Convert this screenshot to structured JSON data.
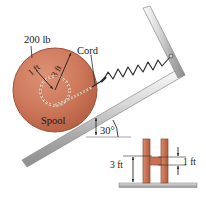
{
  "figure": {
    "type": "engineering-mechanics-diagram",
    "labels": {
      "weight": "200 lb",
      "cord": "Cord",
      "spool": "Spool",
      "inner_radius": "1 ft",
      "outer_radius": "3 ft",
      "incline_angle": "30°",
      "detail_height": "3 ft",
      "detail_hub_width": "1 ft"
    },
    "colors": {
      "spool_fill": "#cd7a5e",
      "spool_edge": "#9e4f38",
      "surface_gray": "#b8b8b8",
      "surface_edge": "#8a8a8a",
      "line_dark": "#2b2b2b",
      "hub_fill": "#c06a4e",
      "background": "#ffffff"
    },
    "geometry": {
      "incline_angle_deg": 30,
      "spool_outer_radius_ft": 3,
      "spool_inner_radius_ft": 1,
      "spool_weight_lb": 200,
      "detail_flange_height_ft": 3,
      "detail_hub_gap_ft": 1
    }
  }
}
